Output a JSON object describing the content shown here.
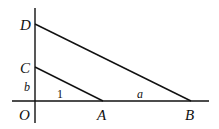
{
  "diagram": {
    "type": "geometry",
    "points": {
      "O": {
        "label": "O"
      },
      "A": {
        "label": "A"
      },
      "B": {
        "label": "B"
      },
      "C": {
        "label": "C"
      },
      "D": {
        "label": "D"
      }
    },
    "segment_labels": {
      "OC": "b",
      "CA": "1",
      "AB": "a"
    },
    "lines": [
      "vertical axis through O, C, D",
      "horizontal axis through O, A, B",
      "segment CA",
      "segment DB"
    ],
    "stroke_color": "#111111"
  }
}
